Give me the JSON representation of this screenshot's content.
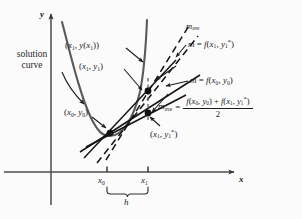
{
  "figure": {
    "background_color": "#fbfbfb",
    "ink_color": "#1c1c1c",
    "curve_color": "#4a4a4a"
  },
  "axes": {
    "y_label": "y",
    "x_label": "x",
    "x_axis_y_px": 172,
    "y_axis_x_px": 51,
    "ticks": [
      {
        "label": "x",
        "sub": "0",
        "x_px": 107
      },
      {
        "label": "x",
        "sub": "1",
        "x_px": 148
      }
    ],
    "interval_brace_label": "h"
  },
  "labels": {
    "solution_curve_line1": "solution",
    "solution_curve_line2": "curve",
    "point_exact": {
      "open": "(",
      "x": "x",
      "xsub": "1",
      "comma": ", ",
      "y": "y",
      "paren_open": "(",
      "ysub": "x",
      "ysubsub": "1",
      "paren_close": ")",
      "close": ")",
      "text": "(x1, y(x1))"
    },
    "point_approx": {
      "text": "(x1, y1)"
    },
    "point_predictor": {
      "text": "(x1, y1*)"
    },
    "point_initial": {
      "text": "(x0, y0)"
    },
    "m_ave_top": "mave",
    "slope_at_x1": "m = f(x1, y1*)",
    "slope_at_x0": "m = f(x0, y0)"
  },
  "formula": {
    "lhs": "mave",
    "equals": "=",
    "numerator_left": "f(x0, y0)",
    "numerator_plus": "+",
    "numerator_right": "f(x1, y1*)",
    "denominator": "2"
  },
  "geometry": {
    "point_x0y0_px": [
      110,
      133
    ],
    "point_x1y1_px": [
      148,
      91
    ],
    "point_x1y1star_px": [
      148,
      113
    ],
    "curve_min_px": [
      105,
      136
    ]
  }
}
